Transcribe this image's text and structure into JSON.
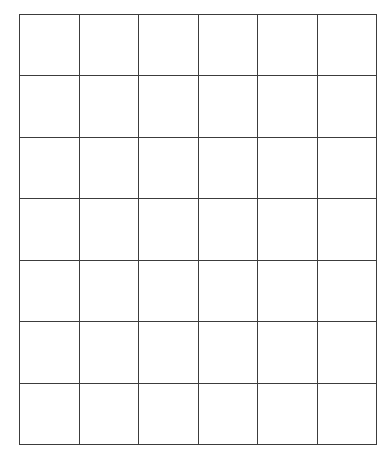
{
  "document": {
    "title": "Blank Grid Worksheet",
    "background_color": "#ffffff",
    "line_color": "#3c3c3c",
    "cell_fill_color": "#ffffff"
  },
  "grid": {
    "columns": 6,
    "rows": 7,
    "total_cells": 42,
    "left": 19,
    "top": 14,
    "right": 377,
    "bottom": 445,
    "width": 358,
    "height": 431,
    "column_width": 59.7,
    "row_height": 61.6,
    "line_thickness": 1.4,
    "column_x_positions": [
      19,
      78,
      138,
      198,
      258,
      318,
      377
    ],
    "row_y_positions": [
      14,
      75,
      137,
      198,
      259,
      321,
      383,
      445
    ],
    "column_headers": [
      "",
      "",
      "",
      "",
      "",
      ""
    ],
    "cells": [
      [
        "",
        "",
        "",
        "",
        "",
        ""
      ],
      [
        "",
        "",
        "",
        "",
        "",
        ""
      ],
      [
        "",
        "",
        "",
        "",
        "",
        ""
      ],
      [
        "",
        "",
        "",
        "",
        "",
        ""
      ],
      [
        "",
        "",
        "",
        "",
        "",
        ""
      ],
      [
        "",
        "",
        "",
        "",
        "",
        ""
      ],
      [
        "",
        "",
        "",
        "",
        "",
        ""
      ]
    ]
  }
}
